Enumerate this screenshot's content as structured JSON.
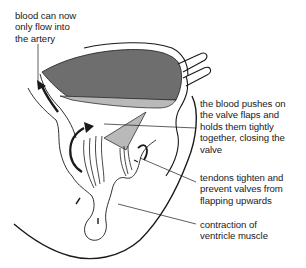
{
  "diagram": {
    "colors": {
      "background": "#ffffff",
      "outline": "#1a1a1a",
      "blood_dark": "#6e6e6e",
      "blood_light": "#b9b9b9",
      "text": "#1a1a1a"
    },
    "labels": [
      {
        "id": "artery",
        "lines": [
          "blood can now",
          "only flow into",
          "the artery"
        ]
      },
      {
        "id": "valve",
        "lines": [
          "the blood pushes on",
          "the valve flaps and",
          "holds them tightly",
          "together, closing the",
          "valve"
        ]
      },
      {
        "id": "tendons",
        "lines": [
          "tendons tighten and",
          "prevent valves from",
          "flapping upwards"
        ]
      },
      {
        "id": "muscle",
        "lines": [
          "contraction of",
          "ventricle muscle"
        ]
      }
    ]
  }
}
